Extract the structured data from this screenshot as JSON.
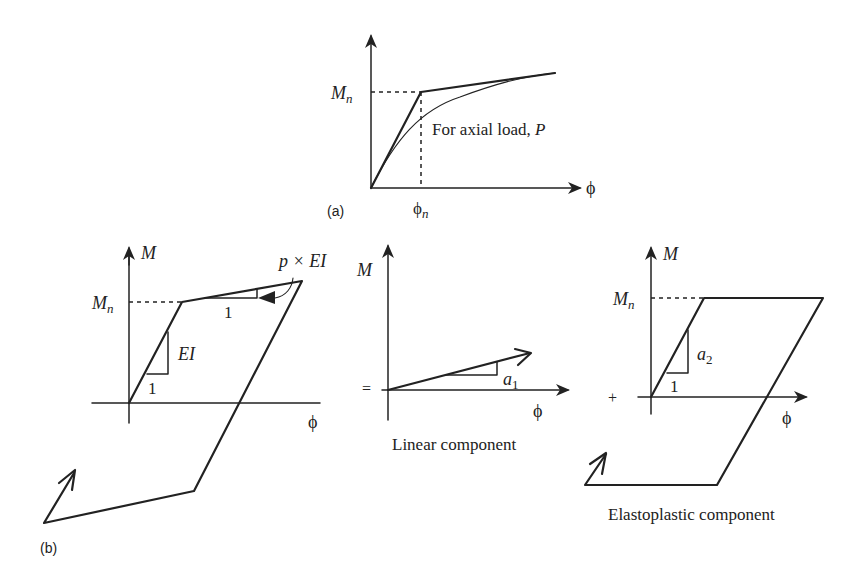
{
  "panel_a": {
    "label": "(a)",
    "y_axis_tick": "M",
    "y_axis_tick_sub": "n",
    "x_axis_label": "ϕ",
    "x_axis_tick": "ϕ",
    "x_axis_tick_sub": "n",
    "curve_note": "For axial load, ",
    "curve_note_var": "P"
  },
  "panel_b": {
    "label": "(b)",
    "total": {
      "y_axis_label": "M",
      "y_tick": "M",
      "y_tick_sub": "n",
      "x_axis_label": "ϕ",
      "elastic_slope_label": "EI",
      "elastic_run_label": "1",
      "hardening_run_label": "1",
      "hardening_slope_label": "p × EI"
    },
    "equals_sign": "=",
    "linear": {
      "y_axis_label": "M",
      "x_axis_label": "ϕ",
      "slope_label": "a",
      "slope_label_sub": "1",
      "caption": "Linear component"
    },
    "plus_sign": "+",
    "elastoplastic": {
      "y_axis_label": "M",
      "y_tick": "M",
      "y_tick_sub": "n",
      "x_axis_label": "ϕ",
      "slope_label": "a",
      "slope_label_sub": "2",
      "run_label": "1",
      "caption": "Elastoplastic component"
    }
  }
}
